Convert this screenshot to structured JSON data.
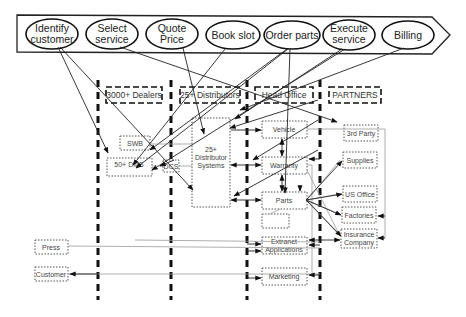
{
  "process_steps": [
    {
      "label_1": "Identify",
      "label_2": "customer"
    },
    {
      "label_1": "Select",
      "label_2": "service"
    },
    {
      "label_1": "Quote",
      "label_2": "Price"
    },
    {
      "label_1": "Book slot",
      "label_2": ""
    },
    {
      "label_1": "Order parts",
      "label_2": ""
    },
    {
      "label_1": "Execute",
      "label_2": "service"
    },
    {
      "label_1": "Billing",
      "label_2": ""
    }
  ],
  "lanes": {
    "dealers": "3000+ Dealers",
    "distributors": "25+ Distributors",
    "head_office": "Head Office",
    "partners": "PARTNERS"
  },
  "systems": {
    "swb": "SWB",
    "dms": "50+ DMS",
    "dcs": "DCS",
    "distributor_systems_1": "25+",
    "distributor_systems_2": "Distributor",
    "distributor_systems_3": "Systems",
    "vehicle": "Vehicle",
    "warranty": "Warranty",
    "parts": "Parts",
    "extranet_1": "Extranet",
    "extranet_2": "Applications",
    "marketing": "Marketing",
    "third_party": "3rd Party",
    "supplies": "Supplies",
    "us_office": "US Office",
    "factories": "Factories",
    "insurance_1": "Insurance",
    "insurance_2": "Company",
    "press": "Press",
    "customer": "Customer"
  }
}
